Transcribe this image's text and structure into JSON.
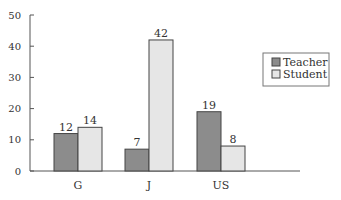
{
  "chart_data": {
    "type": "bar",
    "title": "",
    "xlabel": "",
    "ylabel": "",
    "categories": [
      "G",
      "J",
      "US"
    ],
    "series": [
      {
        "name": "Teacher",
        "values": [
          12,
          7,
          19
        ],
        "color": "#8c8c8c"
      },
      {
        "name": "Student",
        "values": [
          14,
          42,
          8
        ],
        "color": "#e6e6e6"
      }
    ],
    "ylim": [
      0,
      50
    ],
    "yticks": [
      0,
      10,
      20,
      30,
      40,
      50
    ],
    "grid": false,
    "legend_position": "right",
    "data_labels": true
  }
}
